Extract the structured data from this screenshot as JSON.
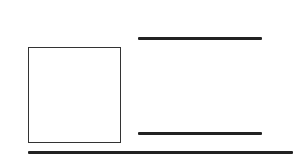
{
  "diagram": {
    "background": "#ffffff",
    "stroke_color": "#222222",
    "elements": [
      {
        "id": "square",
        "type": "rect",
        "x": 28,
        "y": 47,
        "width": 93,
        "height": 96,
        "stroke": "#333333"
      },
      {
        "id": "top-line",
        "type": "line",
        "x1": 138,
        "y1": 38,
        "x2": 262,
        "y2": 38,
        "thickness": 3
      },
      {
        "id": "middle-line",
        "type": "line",
        "x1": 138,
        "y1": 133,
        "x2": 262,
        "y2": 133,
        "thickness": 3
      },
      {
        "id": "bottom-line",
        "type": "line",
        "x1": 28,
        "y1": 152,
        "x2": 293,
        "y2": 152,
        "thickness": 2.5
      }
    ]
  }
}
